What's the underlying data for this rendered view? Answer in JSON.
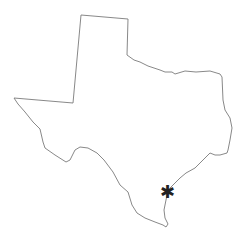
{
  "map": {
    "region": "Texas",
    "outline_color": "#7a7a7a",
    "background": "#ffffff",
    "outline_points": "81,15 128,19 127,55 134,60 140,62 148,66 160,70 165,72 172,72 175,74 185,71 196,72 210,71 220,74 222,77 223,100 225,110 230,118 232,128 230,140 228,150 227,153 220,155 215,155 210,153 208,155 205,158 200,163 195,168 186,173 180,178 175,183 170,188 167,195 166,200 164,210 165,218 168,224 166,227 163,225 155,222 145,218 137,213 132,205 128,192 120,185 113,172 110,168 104,160 97,153 88,148 80,147 75,150 70,160 66,162 55,155 45,148 43,142 40,129 33,122 25,112 18,104 14,98 73,103",
    "marker": {
      "glyph": "✱",
      "x": 168,
      "y": 193,
      "color": "#222222"
    }
  }
}
